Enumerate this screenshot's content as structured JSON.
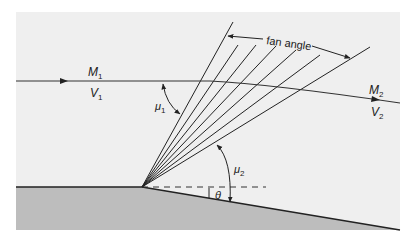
{
  "diagram": {
    "labels": {
      "m1": "M",
      "m1_sub": "1",
      "v1": "V",
      "v1_sub": "1",
      "m2": "M",
      "m2_sub": "2",
      "v2": "V",
      "v2_sub": "2",
      "mu1": "μ",
      "mu1_sub": "1",
      "mu2": "μ",
      "mu2_sub": "2",
      "theta": "θ",
      "fan_angle": "fan angle"
    },
    "colors": {
      "background_panel": "#f0f0f0",
      "wall": "#bcbcbc",
      "line": "#222222"
    }
  }
}
